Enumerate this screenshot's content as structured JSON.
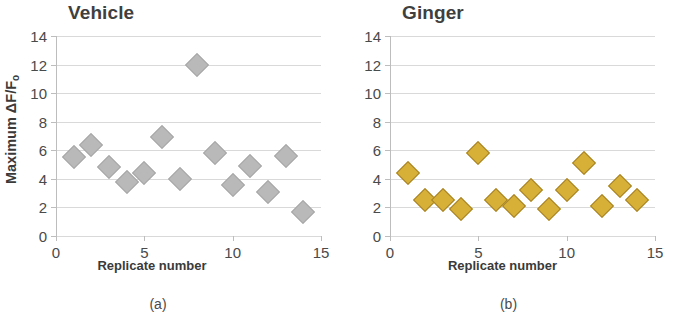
{
  "figure": {
    "panels": [
      {
        "key": "vehicle",
        "title": "Vehicle",
        "subcaption": "(a)",
        "ylabel_main": "Maximum ΔF/F",
        "ylabel_sub": "o",
        "xlabel": "Replicate number",
        "marker_color": "#b9b9b9",
        "marker_border": "#a8832a"
      },
      {
        "key": "ginger",
        "title": "Ginger",
        "subcaption": "(b)",
        "ylabel_main": "",
        "ylabel_sub": "",
        "xlabel": "Replicate number",
        "marker_color": "#d6b037",
        "marker_border": "#a8832a"
      }
    ]
  },
  "chart_data": [
    {
      "type": "scatter",
      "title": "Vehicle",
      "subcaption": "(a)",
      "xlabel": "Replicate number",
      "ylabel": "Maximum ΔF/Fo",
      "xlim": [
        0,
        15
      ],
      "ylim": [
        0,
        14
      ],
      "xticks": [
        0,
        5,
        10,
        15
      ],
      "yticks": [
        0,
        2,
        4,
        6,
        8,
        10,
        12,
        14
      ],
      "grid": true,
      "legend": "none",
      "marker": "diamond",
      "color": "#b9b9b9",
      "x": [
        1,
        2,
        3,
        4,
        5,
        6,
        7,
        8,
        9,
        10,
        11,
        12,
        13,
        14
      ],
      "y": [
        5.5,
        6.4,
        4.8,
        3.8,
        4.4,
        6.9,
        4.0,
        12.0,
        5.8,
        3.6,
        4.9,
        3.1,
        5.6,
        1.7
      ]
    },
    {
      "type": "scatter",
      "title": "Ginger",
      "subcaption": "(b)",
      "xlabel": "Replicate number",
      "ylabel": "Maximum ΔF/Fo",
      "xlim": [
        0,
        15
      ],
      "ylim": [
        0,
        14
      ],
      "xticks": [
        0,
        5,
        10,
        15
      ],
      "yticks": [
        0,
        2,
        4,
        6,
        8,
        10,
        12,
        14
      ],
      "grid": true,
      "legend": "none",
      "marker": "diamond",
      "color": "#d6b037",
      "x": [
        1,
        2,
        3,
        4,
        5,
        6,
        7,
        8,
        9,
        10,
        11,
        12,
        13,
        14
      ],
      "y": [
        4.4,
        2.5,
        2.5,
        1.9,
        5.8,
        2.5,
        2.1,
        3.2,
        1.9,
        3.2,
        5.1,
        2.1,
        3.5,
        2.5
      ]
    }
  ]
}
